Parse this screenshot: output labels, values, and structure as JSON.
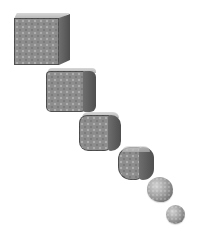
{
  "illustration": {
    "description": "Sequence of six gray textured shapes morphing from a sharp cube into a sphere, arranged diagonally from upper-left to lower-right",
    "background": "#ffffff",
    "shape_color": "#8d8d8d",
    "stages": [
      {
        "name": "cube",
        "corner_rounding": 0
      },
      {
        "name": "slightly-rounded-cube",
        "corner_rounding": 4
      },
      {
        "name": "rounded-cube",
        "corner_rounding": 8
      },
      {
        "name": "very-rounded-cube",
        "corner_rounding": 12
      },
      {
        "name": "near-sphere",
        "corner_rounding": 50
      },
      {
        "name": "sphere",
        "corner_rounding": 50
      }
    ]
  }
}
